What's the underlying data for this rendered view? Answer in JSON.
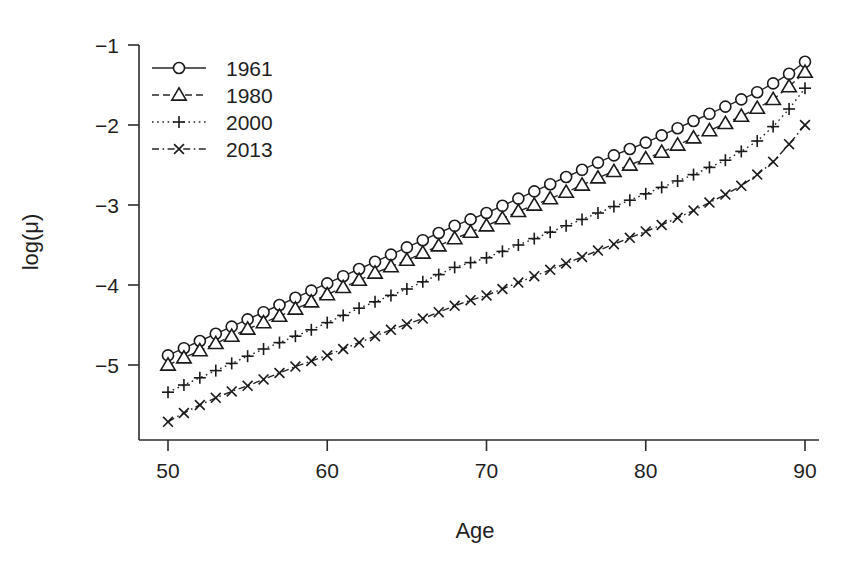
{
  "chart_data": {
    "type": "line",
    "title": "",
    "xlabel": "Age",
    "ylabel": "log(μ)",
    "xlim": [
      50,
      90
    ],
    "ylim": [
      -5.9,
      -0.85
    ],
    "xticks": [
      50,
      60,
      70,
      80,
      90
    ],
    "xticklabels": [
      "50",
      "60",
      "70",
      "80",
      "90"
    ],
    "yticks": [
      -1,
      -2,
      -3,
      -4,
      -5
    ],
    "yticklabels": [
      "−1",
      "−2",
      "−3",
      "−4",
      "−5"
    ],
    "grid": false,
    "legend_position": "top-left",
    "x": [
      50,
      51,
      52,
      53,
      54,
      55,
      56,
      57,
      58,
      59,
      60,
      61,
      62,
      63,
      64,
      65,
      66,
      67,
      68,
      69,
      70,
      71,
      72,
      73,
      74,
      75,
      76,
      77,
      78,
      79,
      80,
      81,
      82,
      83,
      84,
      85,
      86,
      87,
      88,
      89,
      90
    ],
    "series": [
      {
        "name": "1961",
        "linestyle": "solid",
        "marker": "circle",
        "values": [
          -4.88,
          -4.79,
          -4.7,
          -4.61,
          -4.52,
          -4.43,
          -4.34,
          -4.25,
          -4.16,
          -4.07,
          -3.98,
          -3.89,
          -3.8,
          -3.71,
          -3.62,
          -3.53,
          -3.44,
          -3.35,
          -3.26,
          -3.18,
          -3.1,
          -3.01,
          -2.92,
          -2.83,
          -2.74,
          -2.65,
          -2.56,
          -2.47,
          -2.38,
          -2.3,
          -2.22,
          -2.13,
          -2.04,
          -1.95,
          -1.86,
          -1.77,
          -1.68,
          -1.59,
          -1.48,
          -1.36,
          -1.21
        ]
      },
      {
        "name": "1980",
        "linestyle": "dashed",
        "marker": "triangle",
        "values": [
          -5.0,
          -4.91,
          -4.82,
          -4.73,
          -4.64,
          -4.55,
          -4.47,
          -4.39,
          -4.3,
          -4.21,
          -4.12,
          -4.03,
          -3.94,
          -3.85,
          -3.77,
          -3.69,
          -3.6,
          -3.51,
          -3.42,
          -3.34,
          -3.26,
          -3.17,
          -3.08,
          -3.0,
          -2.92,
          -2.84,
          -2.75,
          -2.66,
          -2.58,
          -2.5,
          -2.42,
          -2.34,
          -2.25,
          -2.16,
          -2.07,
          -1.98,
          -1.89,
          -1.79,
          -1.68,
          -1.52,
          -1.34
        ]
      },
      {
        "name": "2000",
        "linestyle": "dotted",
        "marker": "plus",
        "values": [
          -5.34,
          -5.25,
          -5.16,
          -5.07,
          -4.98,
          -4.89,
          -4.8,
          -4.72,
          -4.64,
          -4.56,
          -4.47,
          -4.38,
          -4.29,
          -4.21,
          -4.13,
          -4.05,
          -3.96,
          -3.87,
          -3.78,
          -3.72,
          -3.66,
          -3.58,
          -3.5,
          -3.42,
          -3.34,
          -3.26,
          -3.18,
          -3.1,
          -3.02,
          -2.94,
          -2.86,
          -2.78,
          -2.7,
          -2.62,
          -2.53,
          -2.44,
          -2.33,
          -2.2,
          -2.02,
          -1.8,
          -1.54
        ]
      },
      {
        "name": "2013",
        "linestyle": "dashdot",
        "marker": "x",
        "values": [
          -5.71,
          -5.6,
          -5.5,
          -5.41,
          -5.33,
          -5.26,
          -5.18,
          -5.1,
          -5.02,
          -4.95,
          -4.88,
          -4.8,
          -4.72,
          -4.64,
          -4.56,
          -4.49,
          -4.42,
          -4.34,
          -4.26,
          -4.19,
          -4.13,
          -4.05,
          -3.97,
          -3.89,
          -3.81,
          -3.73,
          -3.65,
          -3.57,
          -3.49,
          -3.41,
          -3.33,
          -3.25,
          -3.16,
          -3.07,
          -2.97,
          -2.87,
          -2.76,
          -2.62,
          -2.46,
          -2.24,
          -2.0
        ]
      }
    ]
  },
  "axis": {
    "x_label": "Age",
    "y_label": "log(μ)"
  },
  "legend": {
    "entries": [
      {
        "label": "1961",
        "marker": "circle-marker",
        "linestyle": "solid"
      },
      {
        "label": "1980",
        "marker": "triangle-marker",
        "linestyle": "dashed"
      },
      {
        "label": "2000",
        "marker": "plus-marker",
        "linestyle": "dotted"
      },
      {
        "label": "2013",
        "marker": "x-marker",
        "linestyle": "dashdot"
      }
    ]
  },
  "colors": {
    "ink": "#1a1a1a",
    "background": "#ffffff"
  }
}
